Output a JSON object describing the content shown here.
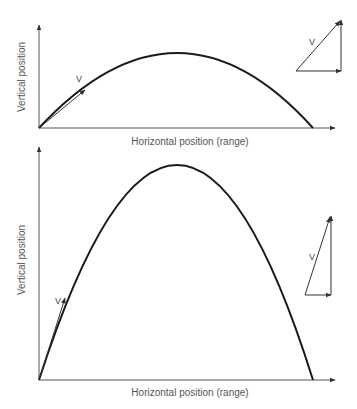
{
  "diagrams": [
    {
      "id": "top",
      "xlabel": "Horizontal position (range)",
      "ylabel": "Vertical position",
      "velocity_label": "V",
      "triangle_label": "V",
      "description": "Low launch angle projectile trajectory"
    },
    {
      "id": "bottom",
      "xlabel": "Horizontal position (range)",
      "ylabel": "Vertical position",
      "velocity_label": "V",
      "triangle_label": "V",
      "description": "High launch angle projectile trajectory"
    }
  ],
  "colors": {
    "axis": "#555555",
    "trajectory": "#1a1a1a",
    "label": "#555555"
  }
}
